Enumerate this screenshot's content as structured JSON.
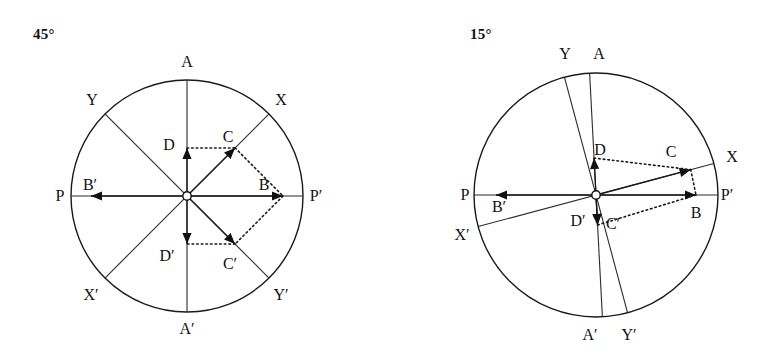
{
  "figure": {
    "background_color": "#ffffff",
    "line_color": "#1a1a1a",
    "panels": [
      {
        "id": "left",
        "title": "45°",
        "angle_deg": 45,
        "circle": {
          "cx": 187,
          "cy": 196,
          "r": 116
        },
        "labels": [
          {
            "name": "A",
            "text": "A",
            "x": 187,
            "y": 63
          },
          {
            "name": "Ap",
            "text": "A′",
            "x": 187,
            "y": 330
          },
          {
            "name": "P",
            "text": "P",
            "x": 60,
            "y": 197
          },
          {
            "name": "Pp",
            "text": "P′",
            "x": 316,
            "y": 197
          },
          {
            "name": "X",
            "text": "X",
            "x": 281,
            "y": 101
          },
          {
            "name": "Xp",
            "text": "X′",
            "x": 91,
            "y": 296
          },
          {
            "name": "Y",
            "text": "Y",
            "x": 92,
            "y": 101
          },
          {
            "name": "Yp",
            "text": "Y′",
            "x": 281,
            "y": 296
          },
          {
            "name": "B",
            "text": "B",
            "x": 264,
            "y": 186
          },
          {
            "name": "Bp",
            "text": "B′",
            "x": 90,
            "y": 186
          },
          {
            "name": "C",
            "text": "C",
            "x": 228,
            "y": 138
          },
          {
            "name": "Cp",
            "text": "C′",
            "x": 230,
            "y": 265
          },
          {
            "name": "D",
            "text": "D",
            "x": 169,
            "y": 146
          },
          {
            "name": "Dp",
            "text": "D′",
            "x": 167,
            "y": 257
          }
        ],
        "axes": [
          {
            "name": "axis-A-Ap",
            "angle_deg": 90
          },
          {
            "name": "axis-P-Pp",
            "angle_deg": 0
          },
          {
            "name": "axis-X-Xp",
            "angle_deg": 45
          },
          {
            "name": "axis-Y-Yp",
            "angle_deg": 135
          }
        ],
        "vectors": [
          {
            "name": "vector-D",
            "angle_deg": 90,
            "length": 48
          },
          {
            "name": "vector-C",
            "angle_deg": 45,
            "length": 68
          },
          {
            "name": "vector-B",
            "angle_deg": 0,
            "length": 96
          },
          {
            "name": "vector-Cp",
            "angle_deg": -45,
            "length": 68
          },
          {
            "name": "vector-Dp",
            "angle_deg": -90,
            "length": 48
          },
          {
            "name": "vector-Bp",
            "angle_deg": 180,
            "length": 96
          }
        ],
        "dotted_links": [
          {
            "name": "link-D-C",
            "from": "D",
            "to": "C"
          },
          {
            "name": "link-C-B",
            "from": "C",
            "to": "B"
          },
          {
            "name": "link-B-Cp",
            "from": "B",
            "to": "Cp"
          },
          {
            "name": "link-Cp-Dp",
            "from": "Cp",
            "to": "Dp"
          }
        ]
      },
      {
        "id": "right",
        "title": "15°",
        "angle_deg": 15,
        "circle": {
          "cx": 211,
          "cy": 195,
          "r": 122
        },
        "labels": [
          {
            "name": "A",
            "text": "A",
            "x": 214,
            "y": 55
          },
          {
            "name": "Ap",
            "text": "A′",
            "x": 205,
            "y": 336
          },
          {
            "name": "P",
            "text": "P",
            "x": 80,
            "y": 196
          },
          {
            "name": "Pp",
            "text": "P′",
            "x": 342,
            "y": 196
          },
          {
            "name": "X",
            "text": "X",
            "x": 347,
            "y": 158
          },
          {
            "name": "Xp",
            "text": "X′",
            "x": 77,
            "y": 236
          },
          {
            "name": "Y",
            "text": "Y",
            "x": 180,
            "y": 55
          },
          {
            "name": "Yp",
            "text": "Y′",
            "x": 244,
            "y": 336
          },
          {
            "name": "B",
            "text": "B",
            "x": 311,
            "y": 214
          },
          {
            "name": "Bp",
            "text": "B′",
            "x": 114,
            "y": 208
          },
          {
            "name": "C",
            "text": "C",
            "x": 286,
            "y": 153
          },
          {
            "name": "Cp",
            "text": "C′",
            "x": 228,
            "y": 225
          },
          {
            "name": "D",
            "text": "D",
            "x": 215,
            "y": 151
          },
          {
            "name": "Dp",
            "text": "D′",
            "x": 193,
            "y": 222
          }
        ],
        "axes": [
          {
            "name": "axis-A-Ap",
            "angle_deg": 93
          },
          {
            "name": "axis-P-Pp",
            "angle_deg": 0
          },
          {
            "name": "axis-X-Xp",
            "angle_deg": 15
          },
          {
            "name": "axis-Y-Yp",
            "angle_deg": 105
          }
        ],
        "vectors": [
          {
            "name": "vector-D",
            "angle_deg": 93,
            "length": 37
          },
          {
            "name": "vector-C",
            "angle_deg": 15,
            "length": 98
          },
          {
            "name": "vector-B",
            "angle_deg": 0,
            "length": 100
          },
          {
            "name": "vector-Cp",
            "angle_deg": -87,
            "length": 30
          },
          {
            "name": "vector-Dp",
            "angle_deg": -87,
            "length": 30
          },
          {
            "name": "vector-Bp",
            "angle_deg": 180,
            "length": 100
          }
        ],
        "dotted_links": [
          {
            "name": "link-D-C",
            "from": "D",
            "to": "C"
          },
          {
            "name": "link-C-B",
            "from": "C",
            "to": "B"
          },
          {
            "name": "link-B-Cp",
            "from": "B",
            "to": "Cp"
          },
          {
            "name": "link-Cp-Dp",
            "from": "Cp",
            "to": "Dp"
          }
        ]
      }
    ]
  }
}
